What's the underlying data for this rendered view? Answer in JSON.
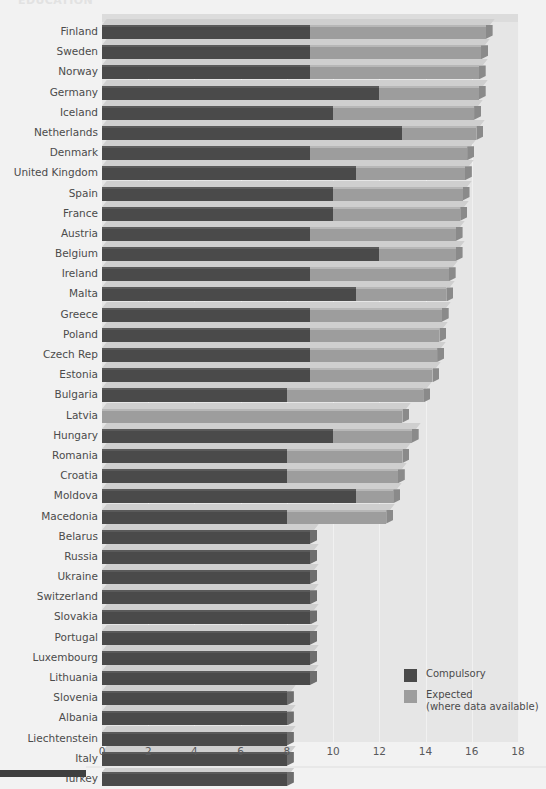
{
  "title_fragment": "EDUCATION",
  "legend": {
    "compulsory_label": "Compulsory",
    "expected_label": "Expected",
    "expected_sub": "(where data available)"
  },
  "colors": {
    "compulsory": "#4a4a4a",
    "expected": "#9d9d9d",
    "plot_background": "#e6e6e6",
    "page_background": "#f2f2f2",
    "label_text": "#4b4b4b"
  },
  "chart_data": {
    "type": "bar",
    "orientation": "horizontal",
    "stacked": true,
    "title": "EDUCATION",
    "xlabel": "",
    "ylabel": "",
    "xlim": [
      0,
      18
    ],
    "xticks": [
      0,
      2,
      4,
      6,
      8,
      10,
      12,
      14,
      16,
      18
    ],
    "grid": true,
    "legend_position": "bottom-right",
    "series": [
      {
        "name": "Compulsory",
        "color": "#4a4a4a",
        "values": [
          9,
          9,
          9,
          12,
          10,
          13,
          9,
          11,
          10,
          10,
          9,
          12,
          9,
          11,
          9,
          9,
          9,
          9,
          8,
          0,
          10,
          8,
          8,
          11,
          8,
          9,
          9,
          9,
          9,
          9,
          9,
          9,
          9,
          8,
          8,
          8,
          8,
          8
        ]
      },
      {
        "name": "Expected (where data available)",
        "color": "#9d9d9d",
        "values": [
          7.6,
          7.4,
          7.3,
          4.3,
          6.1,
          3.2,
          6.8,
          4.7,
          5.6,
          5.5,
          6.3,
          3.3,
          6.0,
          3.9,
          5.7,
          5.6,
          5.5,
          5.3,
          5.9,
          13.0,
          3.4,
          5.0,
          4.8,
          1.6,
          4.3,
          0,
          0,
          0,
          0,
          0,
          0,
          0,
          0,
          0,
          0,
          0,
          0,
          0
        ]
      }
    ],
    "categories": [
      "Finland",
      "Sweden",
      "Norway",
      "Germany",
      "Iceland",
      "Netherlands",
      "Denmark",
      "United Kingdom",
      "Spain",
      "France",
      "Austria",
      "Belgium",
      "Ireland",
      "Malta",
      "Greece",
      "Poland",
      "Czech Rep",
      "Estonia",
      "Bulgaria",
      "Latvia",
      "Hungary",
      "Romania",
      "Croatia",
      "Moldova",
      "Macedonia",
      "Belarus",
      "Russia",
      "Ukraine",
      "Switzerland",
      "Slovakia",
      "Portugal",
      "Luxembourg",
      "Lithuania",
      "Slovenia",
      "Albania",
      "Liechtenstein",
      "Italy",
      "Turkey"
    ]
  }
}
